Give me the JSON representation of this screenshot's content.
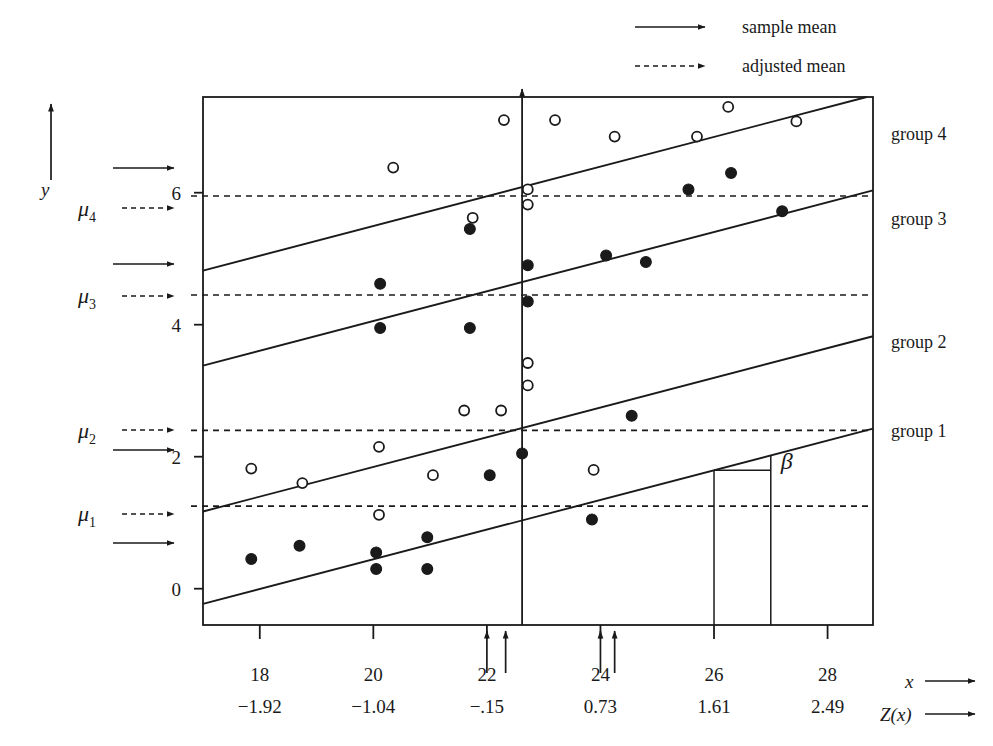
{
  "figure": {
    "axis_labels": {
      "y": "y",
      "x": "x",
      "z": "Z(x)"
    },
    "beta_label": "β"
  },
  "legend": {
    "position": "top-center-right",
    "items": [
      {
        "style": "solid-arrow",
        "label": "sample mean"
      },
      {
        "style": "dashed-arrow",
        "label": "adjusted mean"
      }
    ]
  },
  "group_labels": [
    {
      "name": "group 4",
      "y_px": 140
    },
    {
      "name": "group 3",
      "y_px": 225
    },
    {
      "name": "group 2",
      "y_px": 348
    },
    {
      "name": "group 1",
      "y_px": 437
    }
  ],
  "mu_labels": [
    {
      "symbol": "μ",
      "sub": "4",
      "adjusted_y": 5.95,
      "sample_y": 6.55
    },
    {
      "symbol": "μ",
      "sub": "3",
      "adjusted_y": 4.45,
      "sample_y": 4.95
    },
    {
      "symbol": "μ",
      "sub": "2",
      "adjusted_y": 2.4,
      "sample_y": 2.12
    },
    {
      "symbol": "μ",
      "sub": "1",
      "adjusted_y": 1.25,
      "sample_y": 0.82
    }
  ],
  "chart_data": {
    "type": "scatter",
    "title": "",
    "xlabel": "x",
    "ylabel": "y",
    "xlim": [
      17.0,
      28.8
    ],
    "ylim": [
      -0.55,
      7.45
    ],
    "grid": false,
    "legend_position": "top",
    "x_ticks": [
      18,
      20,
      22,
      24,
      26,
      28
    ],
    "x_tick_labels": [
      "18",
      "20",
      "22",
      "24",
      "26",
      "28"
    ],
    "z_ticks": [
      18,
      20,
      22,
      24,
      26,
      28
    ],
    "z_tick_labels": [
      "−1.92",
      "−1.04",
      "−.15",
      "0.73",
      "1.61",
      "2.49"
    ],
    "y_ticks": [
      0,
      2,
      4,
      6
    ],
    "y_tick_labels": [
      "0",
      "2",
      "4",
      "6"
    ],
    "series": [
      {
        "name": "group 1",
        "marker": "filled-circle",
        "points": [
          [
            17.85,
            0.45
          ],
          [
            18.7,
            0.65
          ],
          [
            20.05,
            0.55
          ],
          [
            20.05,
            0.3
          ],
          [
            20.95,
            0.78
          ],
          [
            20.95,
            0.3
          ],
          [
            22.05,
            1.72
          ],
          [
            22.62,
            2.05
          ],
          [
            23.85,
            1.05
          ],
          [
            24.55,
            2.62
          ]
        ]
      },
      {
        "name": "group 2",
        "marker": "open-circle",
        "points": [
          [
            17.85,
            1.82
          ],
          [
            18.75,
            1.6
          ],
          [
            20.1,
            1.12
          ],
          [
            20.1,
            2.15
          ],
          [
            21.05,
            1.72
          ],
          [
            21.6,
            2.7
          ],
          [
            22.25,
            2.7
          ],
          [
            22.72,
            3.08
          ],
          [
            22.72,
            3.42
          ],
          [
            23.88,
            1.8
          ]
        ]
      },
      {
        "name": "group 3",
        "marker": "filled-circle",
        "points": [
          [
            20.12,
            3.95
          ],
          [
            20.12,
            4.62
          ],
          [
            21.7,
            3.95
          ],
          [
            21.7,
            5.45
          ],
          [
            22.72,
            4.35
          ],
          [
            22.72,
            4.9
          ],
          [
            24.1,
            5.05
          ],
          [
            24.8,
            4.95
          ],
          [
            25.55,
            6.05
          ],
          [
            26.3,
            6.3
          ],
          [
            27.2,
            5.72
          ]
        ]
      },
      {
        "name": "group 4",
        "marker": "open-circle",
        "points": [
          [
            20.35,
            6.38
          ],
          [
            21.75,
            5.62
          ],
          [
            22.3,
            7.1
          ],
          [
            22.72,
            6.05
          ],
          [
            22.72,
            5.82
          ],
          [
            23.2,
            7.1
          ],
          [
            24.25,
            6.85
          ],
          [
            25.7,
            6.85
          ],
          [
            26.25,
            7.3
          ],
          [
            27.45,
            7.08
          ]
        ]
      }
    ],
    "regression_lines": [
      {
        "name": "group 1 line",
        "slope": 0.225,
        "intercept_at_x17": -0.23
      },
      {
        "name": "group 2 line",
        "slope": 0.225,
        "intercept_at_x17": 1.17
      },
      {
        "name": "group 3 line",
        "slope": 0.225,
        "intercept_at_x17": 3.38
      },
      {
        "name": "group 4 line",
        "slope": 0.225,
        "intercept_at_x17": 4.82
      }
    ],
    "adjusted_mean_lines": [
      {
        "name": "mu_1 adjusted",
        "y": 1.25
      },
      {
        "name": "mu_2 adjusted",
        "y": 2.4
      },
      {
        "name": "mu_3 adjusted",
        "y": 4.45
      },
      {
        "name": "mu_4 adjusted",
        "y": 5.95
      }
    ],
    "group_mean_markers_x": [
      22.0,
      22.33,
      24.0,
      24.25
    ],
    "reference_line_x": 22.62,
    "beta_triangle": {
      "x_from": 26.0,
      "x_to": 27.0,
      "label": "β"
    }
  }
}
